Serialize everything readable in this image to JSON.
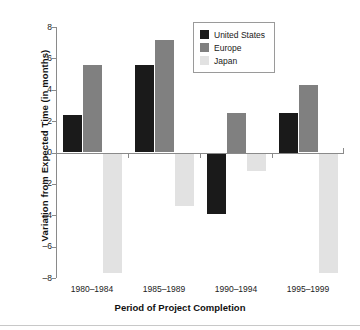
{
  "chart_data": {
    "type": "bar",
    "title": "",
    "xlabel": "Period of Project Completion",
    "ylabel": "Variation from Expected Time (in months)",
    "categories": [
      "1980–1984",
      "1985–1989",
      "1990–1994",
      "1995–1999"
    ],
    "series": [
      {
        "name": "United States",
        "color": "#1a1a1a",
        "values": [
          2.4,
          5.6,
          -3.9,
          2.5
        ]
      },
      {
        "name": "Europe",
        "color": "#808080",
        "values": [
          5.6,
          7.2,
          2.5,
          4.3
        ]
      },
      {
        "name": "Japan",
        "color": "#e2e2e2",
        "values": [
          -7.7,
          -3.4,
          -1.2,
          -7.7
        ]
      }
    ],
    "ylim": [
      -8,
      8
    ],
    "yticks": [
      8,
      6,
      4,
      2,
      0,
      -2,
      -4,
      -6,
      -8
    ],
    "ytick_labels": [
      "8",
      "6",
      "4",
      "2",
      "0",
      "–2",
      "–4",
      "–6",
      "–8"
    ],
    "grid": false,
    "legend_position": "top-right",
    "legend_entries": [
      "United States",
      "Europe",
      "Japan"
    ],
    "zero_reference_line": true
  },
  "axes": {
    "y_title": "Variation from Expected Time (in months)",
    "x_title": "Period of Project Completion"
  },
  "legend": {
    "items": [
      {
        "label": "United States",
        "color": "#1a1a1a"
      },
      {
        "label": "Europe",
        "color": "#808080"
      },
      {
        "label": "Japan",
        "color": "#e2e2e2"
      }
    ]
  }
}
